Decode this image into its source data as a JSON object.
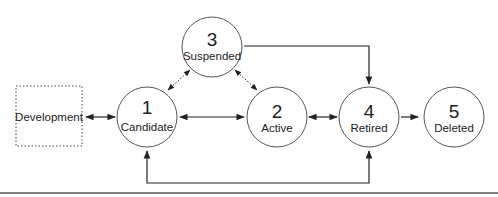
{
  "diagram": {
    "type": "state-lifecycle",
    "development": {
      "label": "Development",
      "style": "dotted-box"
    },
    "states": [
      {
        "id": "1",
        "number": "1",
        "label": "Candidate"
      },
      {
        "id": "2",
        "number": "2",
        "label": "Active"
      },
      {
        "id": "3",
        "number": "3",
        "label": "Suspended"
      },
      {
        "id": "4",
        "number": "4",
        "label": "Retired"
      },
      {
        "id": "5",
        "number": "5",
        "label": "Deleted"
      }
    ],
    "transitions": [
      {
        "from": "Development",
        "to": "Candidate",
        "direction": "bidirectional",
        "style": "solid"
      },
      {
        "from": "Candidate",
        "to": "Active",
        "direction": "bidirectional",
        "style": "solid"
      },
      {
        "from": "Candidate",
        "to": "Suspended",
        "direction": "bidirectional",
        "style": "dotted"
      },
      {
        "from": "Suspended",
        "to": "Active",
        "direction": "bidirectional",
        "style": "dotted"
      },
      {
        "from": "Suspended",
        "to": "Retired",
        "direction": "one-way",
        "style": "solid"
      },
      {
        "from": "Active",
        "to": "Retired",
        "direction": "bidirectional",
        "style": "solid"
      },
      {
        "from": "Retired",
        "to": "Deleted",
        "direction": "one-way",
        "style": "solid"
      },
      {
        "from": "Retired",
        "to": "Candidate",
        "direction": "bidirectional",
        "style": "solid",
        "route": "below"
      }
    ],
    "colors": {
      "stroke": "#333333",
      "text": "#222222",
      "background": "#ffffff",
      "rule": "#555555"
    }
  }
}
